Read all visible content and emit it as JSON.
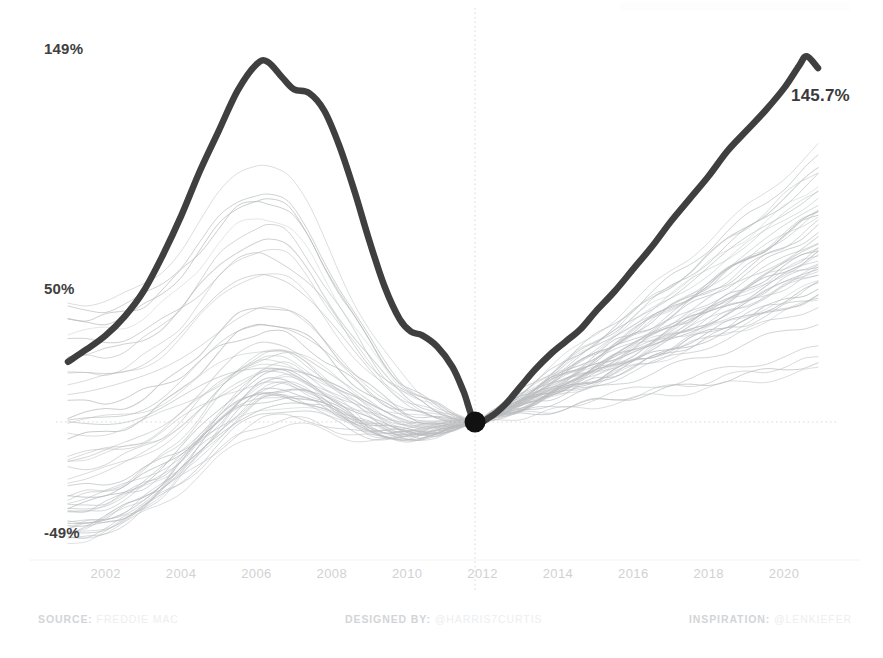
{
  "chart_data": {
    "type": "line",
    "title": "",
    "subtitle": "",
    "xlabel": "",
    "ylabel": "",
    "xlim": [
      2001.0,
      2020.9
    ],
    "ylim": [
      -49,
      149
    ],
    "grid": false,
    "legend": "none",
    "axis_labels": {
      "y_top": "149%",
      "y_mid": "50%",
      "y_bottom": "-49%"
    },
    "y_tick_values": [
      149,
      50,
      -49
    ],
    "x_tick_labels": [
      "2002",
      "2004",
      "2006",
      "2008",
      "2010",
      "2012",
      "2014",
      "2016",
      "2018",
      "2020"
    ],
    "x_tick_values": [
      2002,
      2004,
      2006,
      2008,
      2010,
      2012,
      2014,
      2016,
      2018,
      2020
    ],
    "annotations": [
      {
        "name": "endpoint-value",
        "text": "145.7%",
        "x": 2020.6,
        "y": 141
      },
      {
        "name": "origin-marker",
        "text": "",
        "x": 2011.8,
        "y": 0
      }
    ],
    "reference_lines": {
      "vertical_x": 2011.8,
      "horizontal_y": 0,
      "style": "dotted"
    },
    "highlight_series": {
      "name": "United States",
      "color": "#3f3f3f",
      "x": [
        2001.0,
        2001.5,
        2002.0,
        2002.5,
        2003.0,
        2003.5,
        2004.0,
        2004.5,
        2005.0,
        2005.5,
        2006.0,
        2006.3,
        2006.7,
        2007.0,
        2007.4,
        2007.8,
        2008.2,
        2008.6,
        2009.0,
        2009.4,
        2009.8,
        2010.1,
        2010.4,
        2010.8,
        2011.2,
        2011.5,
        2011.8,
        2012.2,
        2012.6,
        2013.0,
        2013.4,
        2013.8,
        2014.2,
        2014.6,
        2015.0,
        2015.5,
        2016.0,
        2016.5,
        2017.0,
        2017.5,
        2018.0,
        2018.5,
        2019.0,
        2019.5,
        2020.0,
        2020.4,
        2020.6,
        2020.9
      ],
      "y": [
        24.0,
        29.0,
        34.5,
        42.0,
        52.0,
        66.0,
        82.0,
        100.0,
        116.0,
        132.0,
        142.5,
        143.5,
        137.0,
        132.5,
        131.0,
        124.0,
        110.0,
        92.0,
        72.0,
        54.0,
        41.0,
        36.0,
        34.5,
        30.0,
        22.0,
        12.0,
        0.0,
        2.0,
        7.0,
        14.0,
        21.0,
        27.0,
        32.0,
        37.0,
        44.0,
        52.0,
        61.0,
        70.0,
        80.0,
        89.0,
        98.0,
        108.0,
        116.0,
        124.0,
        133.0,
        142.0,
        145.7,
        141.0
      ]
    },
    "background_series": {
      "name": "Individual states",
      "color": "#b9bcbe",
      "count": 51,
      "description": "Thin grey lines: house price index change for each state, all normalized to 0% at 2011.8"
    }
  },
  "footer": {
    "source_key": "SOURCE:",
    "source_value": "FREDDIE MAC",
    "designer_key": "DESIGNED BY:",
    "designer_value": "@HARRIS7CURTIS",
    "inspiration_key": "INSPIRATION:",
    "inspiration_value": "@LENKIEFER"
  },
  "colors": {
    "highlight": "#3f3f3f",
    "background_lines": "#b9bcbe",
    "axis_text": "#cfd2d4",
    "value_text": "#404040",
    "reference_line": "#d8d8d8",
    "page_background": "#ffffff"
  }
}
